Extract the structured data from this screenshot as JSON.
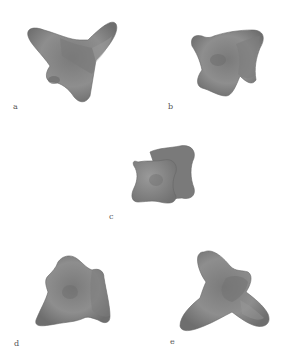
{
  "figure": {
    "panels": [
      {
        "label": "a",
        "description": "rendered 3D shape with three lobes, tilted view"
      },
      {
        "label": "b",
        "description": "rendered 3D shape, two intersecting concave plates, oblique view"
      },
      {
        "label": "c",
        "description": "rendered 3D shape, two parallel concave square plates, front view"
      },
      {
        "label": "d",
        "description": "rendered 3D shape, lobed blob, oblique view"
      },
      {
        "label": "e",
        "description": "rendered 3D shape with three elongated lobes, oblique view"
      }
    ],
    "colors": {
      "background": "#ffffff",
      "surface": "#8a8a8a",
      "surface_dark": "#6a6a6a",
      "surface_light": "#a4a4a4",
      "label": "#555555"
    }
  }
}
